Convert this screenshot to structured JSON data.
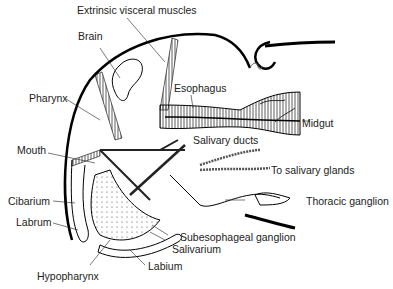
{
  "labels": {
    "extrinsic_visceral_muscles": "Extrinsic visceral muscles",
    "brain": "Brain",
    "esophagus": "Esophagus",
    "pharynx": "Pharynx",
    "midgut": "Midgut",
    "salivary_ducts": "Salivary ducts",
    "mouth": "Mouth",
    "to_salivary_glands": "To salivary glands",
    "thoracic_ganglion": "Thoracic ganglion",
    "cibarium": "Cibarium",
    "labrum": "Labrum",
    "subesophageal_ganglion": "Subesophageal ganglion",
    "salivarium": "Salivarium",
    "labium": "Labium",
    "hypopharynx": "Hypopharynx"
  }
}
